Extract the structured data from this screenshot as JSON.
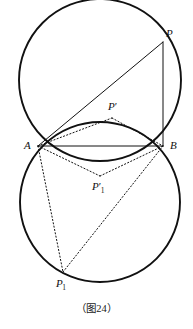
{
  "figure": {
    "caption": "（图24）",
    "stroke_color": "#111111",
    "background_color": "#ffffff",
    "circles": [
      {
        "name": "upper-circle",
        "cx": 100,
        "cy": 80,
        "r": 81,
        "style": "solid",
        "width": 1.9
      },
      {
        "name": "lower-circle",
        "cx": 100,
        "cy": 202,
        "r": 80,
        "style": "solid",
        "width": 1.9
      }
    ],
    "points": [
      {
        "id": "A",
        "label": "A",
        "sub": "",
        "prime": false,
        "x": 38,
        "y": 146,
        "label_x": 24,
        "label_y": 140
      },
      {
        "id": "B",
        "label": "B",
        "sub": "",
        "prime": false,
        "x": 163,
        "y": 146,
        "label_x": 170,
        "label_y": 140
      },
      {
        "id": "P",
        "label": "P",
        "sub": "",
        "prime": false,
        "x": 163,
        "y": 42,
        "label_x": 166,
        "label_y": 28
      },
      {
        "id": "Pprime",
        "label": "P",
        "sub": "",
        "prime": true,
        "x": 112,
        "y": 118,
        "label_x": 108,
        "label_y": 101
      },
      {
        "id": "Pprime1",
        "label": "P",
        "sub": "1",
        "prime": true,
        "x": 100,
        "y": 176,
        "label_x": 92,
        "label_y": 181
      },
      {
        "id": "P1",
        "label": "P",
        "sub": "1",
        "prime": false,
        "x": 63,
        "y": 272,
        "label_x": 56,
        "label_y": 278
      }
    ],
    "segments": [
      {
        "name": "segment-a-b",
        "from": "A",
        "to": "B",
        "style": "solid",
        "width": 1.0
      },
      {
        "name": "segment-a-p",
        "from": "A",
        "to": "P",
        "style": "solid",
        "width": 1.0
      },
      {
        "name": "segment-p-b",
        "from": "P",
        "to": "B",
        "style": "solid",
        "width": 1.0
      },
      {
        "name": "segment-a-pprime",
        "from": "A",
        "to": "Pprime",
        "style": "dotted",
        "width": 1.0
      },
      {
        "name": "segment-pprime-b",
        "from": "Pprime",
        "to": "B",
        "style": "dotted",
        "width": 1.0
      },
      {
        "name": "segment-a-pprime1",
        "from": "A",
        "to": "Pprime1",
        "style": "dotted",
        "width": 1.0
      },
      {
        "name": "segment-pprime1-b",
        "from": "Pprime1",
        "to": "B",
        "style": "dotted",
        "width": 1.0
      },
      {
        "name": "segment-a-p1",
        "from": "A",
        "to": "P1",
        "style": "dotted",
        "width": 1.0
      },
      {
        "name": "segment-p1-b",
        "from": "P1",
        "to": "B",
        "style": "dotted",
        "width": 1.0
      }
    ]
  }
}
